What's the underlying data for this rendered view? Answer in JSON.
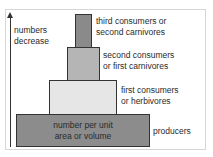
{
  "diagram": {
    "type": "pyramid of numbers",
    "axis": {
      "label_line1": "numbers",
      "label_line2": "decrease",
      "direction": "up"
    },
    "levels": [
      {
        "name": "producers",
        "inner_line1": "number per unit",
        "inner_line2": "area or volume",
        "label_line1": "producers",
        "label_line2": "",
        "color": "#8c8c8c"
      },
      {
        "name": "first consumers",
        "label_line1": "first consumers",
        "label_line2": "or herbivores",
        "color": "#e6e6e6"
      },
      {
        "name": "second consumers",
        "label_line1": "second consumers",
        "label_line2": "or first carnivores",
        "color": "#b5b5b5"
      },
      {
        "name": "third consumers",
        "label_line1": "third consumers or",
        "label_line2": "second carnivores",
        "color": "#8a8a8a"
      }
    ]
  }
}
